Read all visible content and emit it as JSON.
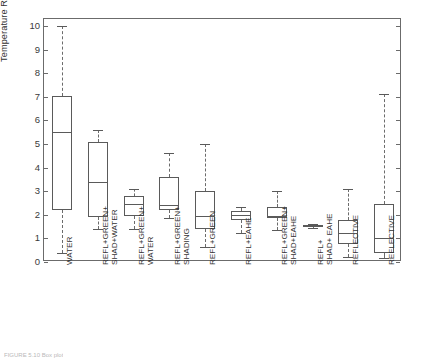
{
  "figure": {
    "caption": "FIGURE 5.10  Box plot",
    "axis_color": "#6b6b6b",
    "box_color": "#5a5a5a"
  },
  "chart_data": {
    "type": "box",
    "title": "",
    "xlabel": "",
    "ylabel": "Temperature Reduction (ºC)",
    "ylim": [
      0,
      10.3
    ],
    "yticks": [
      0,
      1,
      2,
      3,
      4,
      5,
      6,
      7,
      8,
      9,
      10
    ],
    "ytick_labels": [
      "0",
      "1",
      "2",
      "3",
      "4",
      "5",
      "6",
      "7",
      "8",
      "9",
      "10"
    ],
    "grid": false,
    "legend": "none",
    "categories": [
      "WATER",
      "REFL+GREEN+\nSHAD+WATER",
      "REFL+GREEN+\nWATER",
      "REFL+GREEN+\nSHADING",
      "REFL+GREEN",
      "REFL+EAHE",
      "REFL+GREEN+\nSHAD+EAHE",
      "REFL+\nSHAD+ EAHE",
      "REFLECTIVE",
      "REFLECTIVE"
    ],
    "boxes": [
      {
        "label": "WATER",
        "whisker_low": 0.4,
        "q1": 2.2,
        "median": 5.5,
        "q3": 7.05,
        "whisker_high": 10.0
      },
      {
        "label": "REFL+GREEN+SHAD+WATER",
        "whisker_low": 1.4,
        "q1": 1.9,
        "median": 3.4,
        "q3": 5.1,
        "whisker_high": 5.6
      },
      {
        "label": "REFL+GREEN+WATER",
        "whisker_low": 1.4,
        "q1": 1.95,
        "median": 2.45,
        "q3": 2.8,
        "whisker_high": 3.1
      },
      {
        "label": "REFL+GREEN+SHADING",
        "whisker_low": 1.85,
        "q1": 2.2,
        "median": 2.4,
        "q3": 3.6,
        "whisker_high": 4.6
      },
      {
        "label": "REFL+GREEN",
        "whisker_low": 0.65,
        "q1": 1.4,
        "median": 1.95,
        "q3": 3.0,
        "whisker_high": 5.0
      },
      {
        "label": "REFL+EAHE",
        "whisker_low": 1.25,
        "q1": 1.8,
        "median": 2.0,
        "q3": 2.15,
        "whisker_high": 2.35
      },
      {
        "label": "REFL+GREEN+SHAD+EAHE",
        "whisker_low": 1.35,
        "q1": 1.85,
        "median": 1.95,
        "q3": 2.35,
        "whisker_high": 3.0
      },
      {
        "label": "REFL+SHAD+EAHE",
        "whisker_low": 1.45,
        "q1": 1.48,
        "median": 1.52,
        "q3": 1.58,
        "whisker_high": 1.6
      },
      {
        "label": "REFLECTIVE",
        "whisker_low": 0.2,
        "q1": 0.75,
        "median": 1.25,
        "q3": 1.8,
        "whisker_high": 3.1
      },
      {
        "label": "REFLECTIVE",
        "whisker_low": 0.15,
        "q1": 0.4,
        "median": 1.0,
        "q3": 2.45,
        "whisker_high": 7.1
      }
    ]
  }
}
